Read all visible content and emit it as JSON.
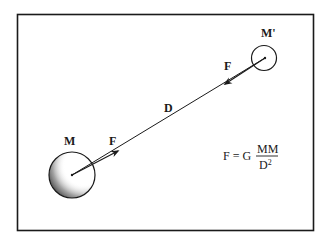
{
  "diagram": {
    "colors": {
      "ink": "#1a1a1a",
      "background": "#ffffff",
      "shading": "#333333"
    },
    "bodies": [
      {
        "id": "mass-m",
        "label": "M",
        "cx": 72,
        "cy": 175,
        "r": 23,
        "shaded": true
      },
      {
        "id": "mass-m-prime",
        "label": "M'",
        "cx": 265,
        "cy": 58,
        "r": 12,
        "shaded": false
      }
    ],
    "line": {
      "label": "D"
    },
    "forces": [
      {
        "label": "F",
        "on": "M",
        "direction": "toward M'"
      },
      {
        "label": "F",
        "on": "M'",
        "direction": "toward M"
      }
    ],
    "formula": {
      "lhs": "F = G",
      "numerator": "MM",
      "denominator_base": "D",
      "denominator_exp": "2"
    }
  }
}
